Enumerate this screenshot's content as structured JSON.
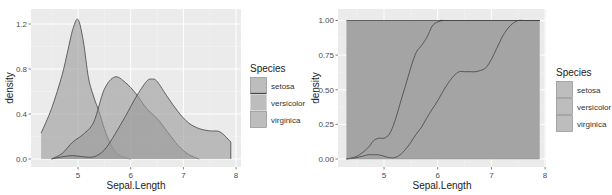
{
  "chart_data": [
    {
      "type": "area",
      "subtype": "density",
      "title": "",
      "xlabel": "Sepal.Length",
      "ylabel": "density",
      "xlim": [
        4.3,
        7.9
      ],
      "ylim": [
        0,
        1.27
      ],
      "xticks": [
        5,
        6,
        7,
        8
      ],
      "xtick_labels": [
        "5",
        "6",
        "7",
        "8"
      ],
      "yticks": [
        0.0,
        0.4,
        0.8,
        1.2
      ],
      "ytick_labels": [
        "0.0",
        "0.4",
        "0.8",
        "1.2"
      ],
      "grid": true,
      "legend": {
        "title": "Species",
        "position": "right",
        "entries": [
          "setosa",
          "versicolor",
          "virginica"
        ]
      },
      "series": [
        {
          "name": "setosa",
          "x": [
            4.3,
            4.5,
            4.7,
            4.8,
            4.9,
            5.0,
            5.1,
            5.2,
            5.3,
            5.4,
            5.5,
            5.6,
            5.7,
            5.8,
            5.9,
            6.0
          ],
          "y": [
            0.23,
            0.45,
            0.75,
            0.95,
            1.15,
            1.24,
            1.05,
            0.72,
            0.55,
            0.42,
            0.27,
            0.15,
            0.07,
            0.03,
            0.01,
            0.0
          ]
        },
        {
          "name": "versicolor",
          "x": [
            4.5,
            4.7,
            4.9,
            5.1,
            5.3,
            5.5,
            5.7,
            5.9,
            6.1,
            6.3,
            6.5,
            6.7,
            6.9,
            7.1,
            7.3
          ],
          "y": [
            0.0,
            0.05,
            0.15,
            0.22,
            0.33,
            0.62,
            0.73,
            0.68,
            0.58,
            0.45,
            0.36,
            0.24,
            0.12,
            0.04,
            0.0
          ]
        },
        {
          "name": "virginica",
          "x": [
            4.5,
            4.7,
            4.9,
            5.1,
            5.3,
            5.5,
            5.7,
            5.9,
            6.1,
            6.3,
            6.4,
            6.5,
            6.7,
            6.9,
            7.1,
            7.3,
            7.5,
            7.7,
            7.9
          ],
          "y": [
            0.0,
            0.02,
            0.03,
            0.02,
            0.02,
            0.08,
            0.22,
            0.38,
            0.55,
            0.69,
            0.71,
            0.69,
            0.55,
            0.42,
            0.32,
            0.27,
            0.25,
            0.24,
            0.15
          ]
        }
      ]
    },
    {
      "type": "area",
      "subtype": "conditional-density (position fill)",
      "title": "",
      "xlabel": "Sepal.Length",
      "ylabel": "density",
      "xlim": [
        4.3,
        7.9
      ],
      "ylim": [
        0,
        1
      ],
      "xticks": [
        5,
        6,
        7,
        8
      ],
      "xtick_labels": [
        "5",
        "6",
        "7",
        "8"
      ],
      "yticks": [
        0.0,
        0.25,
        0.5,
        0.75,
        1.0
      ],
      "ytick_labels": [
        "0.00",
        "0.25",
        "0.50",
        "0.75",
        "1.00"
      ],
      "grid": true,
      "legend": {
        "title": "Species",
        "position": "right",
        "entries": [
          "setosa",
          "versicolor",
          "virginica"
        ]
      },
      "series": [
        {
          "name": "upper boundary (virginica+versicolor cumulative)",
          "x": [
            4.3,
            4.5,
            4.7,
            4.8,
            4.9,
            5.0,
            5.1,
            5.2,
            5.3,
            5.4,
            5.5,
            5.6,
            5.7,
            5.8,
            5.9,
            6.0,
            6.1,
            6.2
          ],
          "y": [
            0.0,
            0.02,
            0.08,
            0.13,
            0.15,
            0.15,
            0.18,
            0.27,
            0.4,
            0.53,
            0.66,
            0.77,
            0.82,
            0.88,
            0.96,
            0.99,
            1.0,
            1.0
          ]
        },
        {
          "name": "lower boundary (virginica cumulative)",
          "x": [
            4.3,
            4.5,
            4.7,
            4.8,
            4.9,
            5.0,
            5.1,
            5.2,
            5.3,
            5.4,
            5.5,
            5.6,
            5.7,
            5.8,
            5.9,
            6.0,
            6.1,
            6.2,
            6.3,
            6.4,
            6.5,
            6.6,
            6.7,
            6.8,
            6.9,
            7.0,
            7.1,
            7.2,
            7.3,
            7.4,
            7.5,
            7.6,
            7.7,
            7.9
          ],
          "y": [
            0.0,
            0.01,
            0.03,
            0.03,
            0.03,
            0.02,
            0.01,
            0.01,
            0.03,
            0.07,
            0.12,
            0.18,
            0.23,
            0.3,
            0.36,
            0.42,
            0.49,
            0.55,
            0.6,
            0.63,
            0.63,
            0.63,
            0.63,
            0.64,
            0.66,
            0.72,
            0.8,
            0.88,
            0.94,
            0.98,
            1.0,
            1.0,
            1.0,
            1.0
          ]
        }
      ]
    }
  ],
  "legend": {
    "title": "Species",
    "items": [
      "setosa",
      "versicolor",
      "virginica"
    ]
  },
  "colors": {
    "panel_bg": "#ebebeb",
    "grid_major": "#ffffff",
    "fill": "#999999",
    "fill_opacity": 0.6,
    "line": "#444444"
  }
}
